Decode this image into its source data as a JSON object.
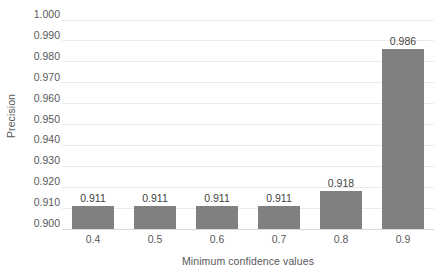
{
  "chart_data": {
    "type": "bar",
    "title": "",
    "xlabel": "Minimum confidence values",
    "ylabel": "Precision",
    "categories": [
      "0.4",
      "0.5",
      "0.6",
      "0.7",
      "0.8",
      "0.9"
    ],
    "values": [
      0.911,
      0.911,
      0.911,
      0.911,
      0.918,
      0.986
    ],
    "data_labels": [
      "0.911",
      "0.911",
      "0.911",
      "0.911",
      "0.918",
      "0.986"
    ],
    "ylim": [
      0.9,
      1.0
    ],
    "ytick_step": 0.01,
    "ytick_labels": [
      "1.000",
      "0.990",
      "0.980",
      "0.970",
      "0.960",
      "0.950",
      "0.940",
      "0.930",
      "0.920",
      "0.910",
      "0.900"
    ],
    "ytick_values": [
      1.0,
      0.99,
      0.98,
      0.97,
      0.96,
      0.95,
      0.94,
      0.93,
      0.92,
      0.91,
      0.9
    ],
    "grid": true,
    "grid_orientation": "horizontal",
    "legend": false,
    "legend_position": "none",
    "series": [
      {
        "name": "Precision",
        "values": [
          0.911,
          0.911,
          0.911,
          0.911,
          0.918,
          0.986
        ],
        "color": "#808080"
      }
    ],
    "colors": {
      "bar": "#808080",
      "gridline": "#eaeaec",
      "baseline": "#d9d9db",
      "tick_text": "#59595b",
      "data_label_text": "#3f3f41",
      "background": "#ffffff"
    }
  }
}
